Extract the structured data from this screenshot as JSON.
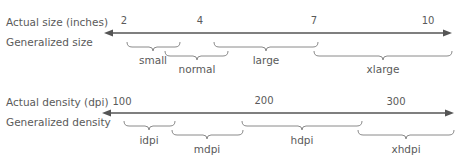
{
  "size_scale": {
    "axis_label": "Actual size (inches)",
    "group_label": "Generalized size",
    "ticks": [
      {
        "label": "2",
        "x": 124
      },
      {
        "label": "4",
        "x": 200
      },
      {
        "label": "7",
        "x": 314
      },
      {
        "label": "10",
        "x": 428
      }
    ],
    "categories": [
      {
        "label": "small",
        "x1": 127,
        "x2": 180,
        "row": 0
      },
      {
        "label": "normal",
        "x1": 165,
        "x2": 228,
        "row": 1
      },
      {
        "label": "large",
        "x1": 214,
        "x2": 318,
        "row": 0
      },
      {
        "label": "xlarge",
        "x1": 314,
        "x2": 452,
        "row": 1
      }
    ]
  },
  "density_scale": {
    "axis_label": "Actual density (dpi)",
    "group_label": "Generalized density",
    "ticks": [
      {
        "label": "100",
        "x": 122
      },
      {
        "label": "200",
        "x": 264
      },
      {
        "label": "300",
        "x": 396
      }
    ],
    "categories": [
      {
        "label": "idpi",
        "x1": 124,
        "x2": 175,
        "row": 0
      },
      {
        "label": "mdpi",
        "x1": 172,
        "x2": 243,
        "row": 1
      },
      {
        "label": "hdpi",
        "x1": 242,
        "x2": 362,
        "row": 0
      },
      {
        "label": "xhdpi",
        "x1": 358,
        "x2": 454,
        "row": 1
      }
    ]
  },
  "colors": {
    "line": "#555555",
    "brace": "#8a8a8a",
    "text": "#5a5a5a"
  }
}
